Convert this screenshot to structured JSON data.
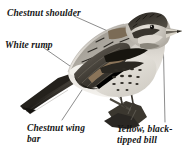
{
  "figure": {
    "kind": "bird-field-guide-illustration",
    "background_color": "#ffffff",
    "ink_color": "#151515",
    "leader_line_color": "#6e6e6e"
  },
  "labels": [
    {
      "id": "chestnut-shoulder",
      "text": "Chestnut shoulder",
      "position": "top-left",
      "points_to": "shoulder / lesser coverts"
    },
    {
      "id": "white-rump",
      "text": "White rump",
      "position": "left",
      "points_to": "rump above tail"
    },
    {
      "id": "chestnut-wing-bar",
      "text": "Chestnut wing\nbar",
      "position": "bottom-left",
      "points_to": "wing bar on folded wing"
    },
    {
      "id": "yellow-black-tipped-bill",
      "text": "Yellow, black-\ntipped bill",
      "position": "bottom-right",
      "points_to": "bill tip"
    }
  ]
}
